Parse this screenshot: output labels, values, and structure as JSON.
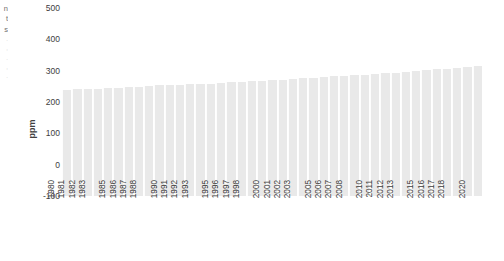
{
  "chart_data": {
    "type": "bar",
    "title": "",
    "subtitle": "",
    "xlabel": "",
    "ylabel": "ppm",
    "ylim": [
      -100,
      500
    ],
    "y_ticks": [
      500,
      400,
      300,
      200,
      100,
      0,
      -100
    ],
    "grid": false,
    "legend": null,
    "bar_color": "#e9e9e9",
    "x_tick_labels": [
      "1980",
      "1981",
      "1982",
      "1983",
      "",
      "1985",
      "1986",
      "1987",
      "1988",
      "",
      "1990",
      "1991",
      "1992",
      "1993",
      "",
      "1995",
      "1996",
      "1997",
      "1998",
      "",
      "2000",
      "2001",
      "2002",
      "2003",
      "",
      "2005",
      "2006",
      "2007",
      "2008",
      "",
      "2010",
      "2011",
      "2012",
      "2013",
      "",
      "2015",
      "2016",
      "2017",
      "2018",
      "",
      "2020"
    ],
    "categories": [
      "1980",
      "1981",
      "1982",
      "1983",
      "1984",
      "1985",
      "1986",
      "1987",
      "1988",
      "1989",
      "1990",
      "1991",
      "1992",
      "1993",
      "1994",
      "1995",
      "1996",
      "1997",
      "1998",
      "1999",
      "2000",
      "2001",
      "2002",
      "2003",
      "2004",
      "2005",
      "2006",
      "2007",
      "2008",
      "2009",
      "2010",
      "2011",
      "2012",
      "2013",
      "2014",
      "2015",
      "2016",
      "2017",
      "2018",
      "2019",
      "2020"
    ],
    "values": [
      338.8,
      340.1,
      341.4,
      343.1,
      344.7,
      346.1,
      347.4,
      349.2,
      351.6,
      353.1,
      354.4,
      355.6,
      356.4,
      357.1,
      358.8,
      360.8,
      362.6,
      363.7,
      366.6,
      368.3,
      369.5,
      371.0,
      373.2,
      375.8,
      377.5,
      379.8,
      381.9,
      383.8,
      385.6,
      387.4,
      389.9,
      391.6,
      393.9,
      396.5,
      398.6,
      400.8,
      404.2,
      406.5,
      408.5,
      411.4,
      414.2
    ]
  },
  "edge_text": {
    "line1": "n",
    "line2": "t",
    "line3": "s",
    "line4": ".",
    "line5": ",",
    "line6": ".",
    "line7": ",",
    "line8": "."
  }
}
